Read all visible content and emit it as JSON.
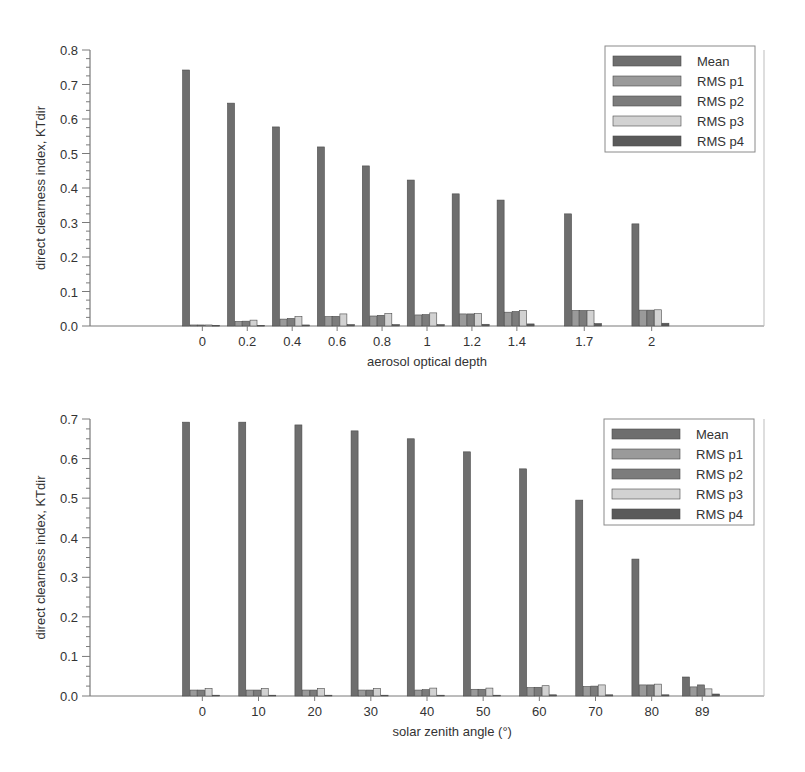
{
  "colors": {
    "Mean": "#6e6e6e",
    "RMS p1": "#9a9a9a",
    "RMS p2": "#7c7c7c",
    "RMS p3": "#d2d2d2",
    "RMS p4": "#5a5a5a",
    "axis": "#7a7a7a",
    "text": "#333333"
  },
  "chart_data": [
    {
      "type": "bar",
      "title": "",
      "xlabel": "aerosol optical depth",
      "ylabel": "direct clearness index, KTdir",
      "xlim": [
        -0.5,
        2.5
      ],
      "ylim": [
        0,
        0.8
      ],
      "yticks": [
        "0.0",
        "0.1",
        "0.2",
        "0.3",
        "0.4",
        "0.5",
        "0.6",
        "0.7",
        "0.8"
      ],
      "grid": false,
      "legend_position": "upper right",
      "categories": [
        "0",
        "0.2",
        "0.4",
        "0.6",
        "0.8",
        "1",
        "1.2",
        "1.4",
        "1.7",
        "2"
      ],
      "x": [
        0,
        0.2,
        0.4,
        0.6,
        0.8,
        1.0,
        1.2,
        1.4,
        1.7,
        2.0
      ],
      "series": [
        {
          "name": "Mean",
          "values": [
            0.742,
            0.646,
            0.577,
            0.519,
            0.464,
            0.423,
            0.383,
            0.365,
            0.325,
            0.296
          ]
        },
        {
          "name": "RMS p1",
          "values": [
            0.003,
            0.013,
            0.02,
            0.027,
            0.029,
            0.032,
            0.035,
            0.04,
            0.045,
            0.046
          ]
        },
        {
          "name": "RMS p2",
          "values": [
            0.003,
            0.014,
            0.022,
            0.028,
            0.031,
            0.033,
            0.035,
            0.042,
            0.045,
            0.046
          ]
        },
        {
          "name": "RMS p3",
          "values": [
            0.003,
            0.017,
            0.027,
            0.035,
            0.036,
            0.038,
            0.036,
            0.045,
            0.045,
            0.047
          ]
        },
        {
          "name": "RMS p4",
          "values": [
            0.002,
            0.002,
            0.003,
            0.004,
            0.004,
            0.004,
            0.005,
            0.006,
            0.007,
            0.008
          ]
        }
      ]
    },
    {
      "type": "bar",
      "title": "",
      "xlabel": "solar zenith angle (°)",
      "ylabel": "direct clearness index, KTdir",
      "xlim": [
        -20,
        100
      ],
      "ylim": [
        0,
        0.7
      ],
      "yticks": [
        "0.0",
        "0.1",
        "0.2",
        "0.3",
        "0.4",
        "0.5",
        "0.6",
        "0.7"
      ],
      "grid": false,
      "legend_position": "upper right",
      "categories": [
        "0",
        "10",
        "20",
        "30",
        "40",
        "50",
        "60",
        "70",
        "80",
        "89"
      ],
      "x": [
        0,
        10,
        20,
        30,
        40,
        50,
        60,
        70,
        80,
        89
      ],
      "series": [
        {
          "name": "Mean",
          "values": [
            0.692,
            0.692,
            0.685,
            0.67,
            0.65,
            0.617,
            0.574,
            0.495,
            0.346,
            0.048
          ]
        },
        {
          "name": "RMS p1",
          "values": [
            0.015,
            0.015,
            0.015,
            0.015,
            0.015,
            0.017,
            0.021,
            0.024,
            0.028,
            0.023
          ]
        },
        {
          "name": "RMS p2",
          "values": [
            0.015,
            0.015,
            0.015,
            0.015,
            0.016,
            0.017,
            0.022,
            0.025,
            0.028,
            0.028
          ]
        },
        {
          "name": "RMS p3",
          "values": [
            0.019,
            0.019,
            0.019,
            0.019,
            0.02,
            0.02,
            0.026,
            0.028,
            0.03,
            0.018
          ]
        },
        {
          "name": "RMS p4",
          "values": [
            0.002,
            0.002,
            0.002,
            0.002,
            0.002,
            0.002,
            0.003,
            0.003,
            0.003,
            0.005
          ]
        }
      ]
    }
  ]
}
